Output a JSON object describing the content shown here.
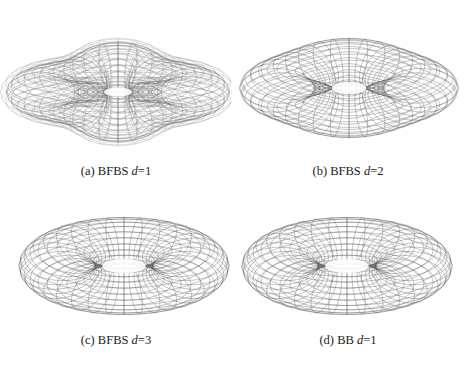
{
  "figure": {
    "panels": [
      {
        "id": "a",
        "label": "(a)",
        "method": "BFBS",
        "var": "d",
        "eq": "=1",
        "caption": "(a) BFBS d=1",
        "cx": 118,
        "cy": 92,
        "R": 68,
        "r": 34,
        "tilt": 0.42,
        "wobble": 0.22,
        "hole": 0.55,
        "stroke": "#6e6e6e",
        "caption_y": 172,
        "outer_shell": true
      },
      {
        "id": "b",
        "label": "(b)",
        "method": "BFBS",
        "var": "d",
        "eq": "=2",
        "caption": "(b) BFBS d=2",
        "cx": 117,
        "cy": 88,
        "R": 70,
        "r": 37,
        "tilt": 0.44,
        "wobble": 0.08,
        "hole": 0.7,
        "stroke": "#555555",
        "caption_y": 172,
        "outer_shell": false
      },
      {
        "id": "c",
        "label": "(c)",
        "method": "BFBS",
        "var": "d",
        "eq": "=3",
        "caption": "(c) BFBS d=3",
        "cx": 124,
        "cy": 79,
        "R": 67,
        "r": 38,
        "tilt": 0.46,
        "wobble": 0.0,
        "hole": 1.0,
        "stroke": "#505050",
        "caption_y": 154,
        "outer_shell": false
      },
      {
        "id": "d",
        "label": "(d)",
        "method": "BB",
        "var": "d",
        "eq": "=1",
        "caption": "(d) BB d=1",
        "cx": 115,
        "cy": 79,
        "R": 67,
        "r": 38,
        "tilt": 0.46,
        "wobble": 0.0,
        "hole": 1.0,
        "stroke": "#505050",
        "caption_y": 154,
        "outer_shell": false
      }
    ]
  }
}
